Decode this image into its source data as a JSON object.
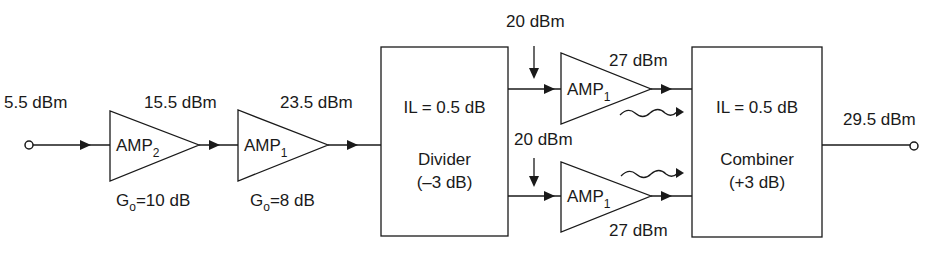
{
  "input": {
    "power": "5.5 dBm"
  },
  "output": {
    "power": "29.5 dBm"
  },
  "stage1": {
    "name": "AMP",
    "sub": "2",
    "out_power": "15.5 dBm",
    "gain_prefix": "G",
    "gain_sub": "o",
    "gain_value": "=10 dB"
  },
  "stage2": {
    "name": "AMP",
    "sub": "1",
    "out_power": "23.5 dBm",
    "gain_prefix": "G",
    "gain_sub": "o",
    "gain_value": "=8 dB"
  },
  "divider": {
    "il": "IL = 0.5 dB",
    "name": "Divider",
    "gain": "(–3 dB)"
  },
  "branch_top": {
    "in_power": "20 dBm",
    "name": "AMP",
    "sub": "1",
    "out_power": "27 dBm"
  },
  "branch_bottom": {
    "in_power": "20 dBm",
    "name": "AMP",
    "sub": "1",
    "out_power": "27 dBm"
  },
  "combiner": {
    "il": "IL = 0.5 dB",
    "name": "Combiner",
    "gain": "(+3 dB)"
  },
  "colors": {
    "stroke": "#1a1a1a",
    "background": "#ffffff"
  }
}
